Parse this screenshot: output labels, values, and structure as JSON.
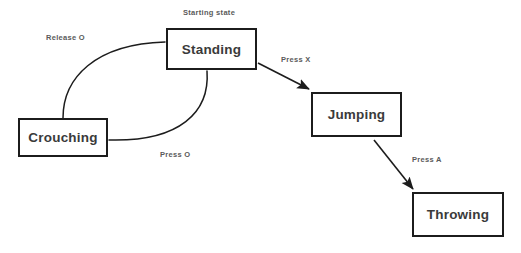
{
  "diagram": {
    "type": "state-machine",
    "title": "",
    "background_color": "#ffffff",
    "node_border_color": "#1c1c1c",
    "node_fill_color": "#ffffff",
    "node_text_color": "#3a3a3a",
    "edge_color": "#1c1c1c",
    "edge_label_color": "#5a5a5a",
    "nodes": [
      {
        "id": "standing",
        "label": "Standing",
        "x": 166,
        "y": 28,
        "width": 91,
        "height": 42
      },
      {
        "id": "crouching",
        "label": "Crouching",
        "x": 18,
        "y": 118,
        "width": 90,
        "height": 39
      },
      {
        "id": "jumping",
        "label": "Jumping",
        "x": 311,
        "y": 92,
        "width": 91,
        "height": 45
      },
      {
        "id": "throwing",
        "label": "Throwing",
        "x": 412,
        "y": 192,
        "width": 92,
        "height": 45
      }
    ],
    "annotations": [
      {
        "id": "starting-state",
        "label": "Starting state",
        "target": "standing"
      }
    ],
    "edges": [
      {
        "id": "standing-to-crouching",
        "from": "standing",
        "to": "crouching",
        "label": "Press O",
        "style": "curved",
        "arrowhead": false
      },
      {
        "id": "crouching-to-standing",
        "from": "crouching",
        "to": "standing",
        "label": "Release O",
        "style": "curved",
        "arrowhead": false
      },
      {
        "id": "standing-to-jumping",
        "from": "standing",
        "to": "jumping",
        "label": "Press X",
        "style": "straight",
        "arrowhead": true
      },
      {
        "id": "jumping-to-throwing",
        "from": "jumping",
        "to": "throwing",
        "label": "Press A",
        "style": "straight",
        "arrowhead": true
      }
    ]
  }
}
